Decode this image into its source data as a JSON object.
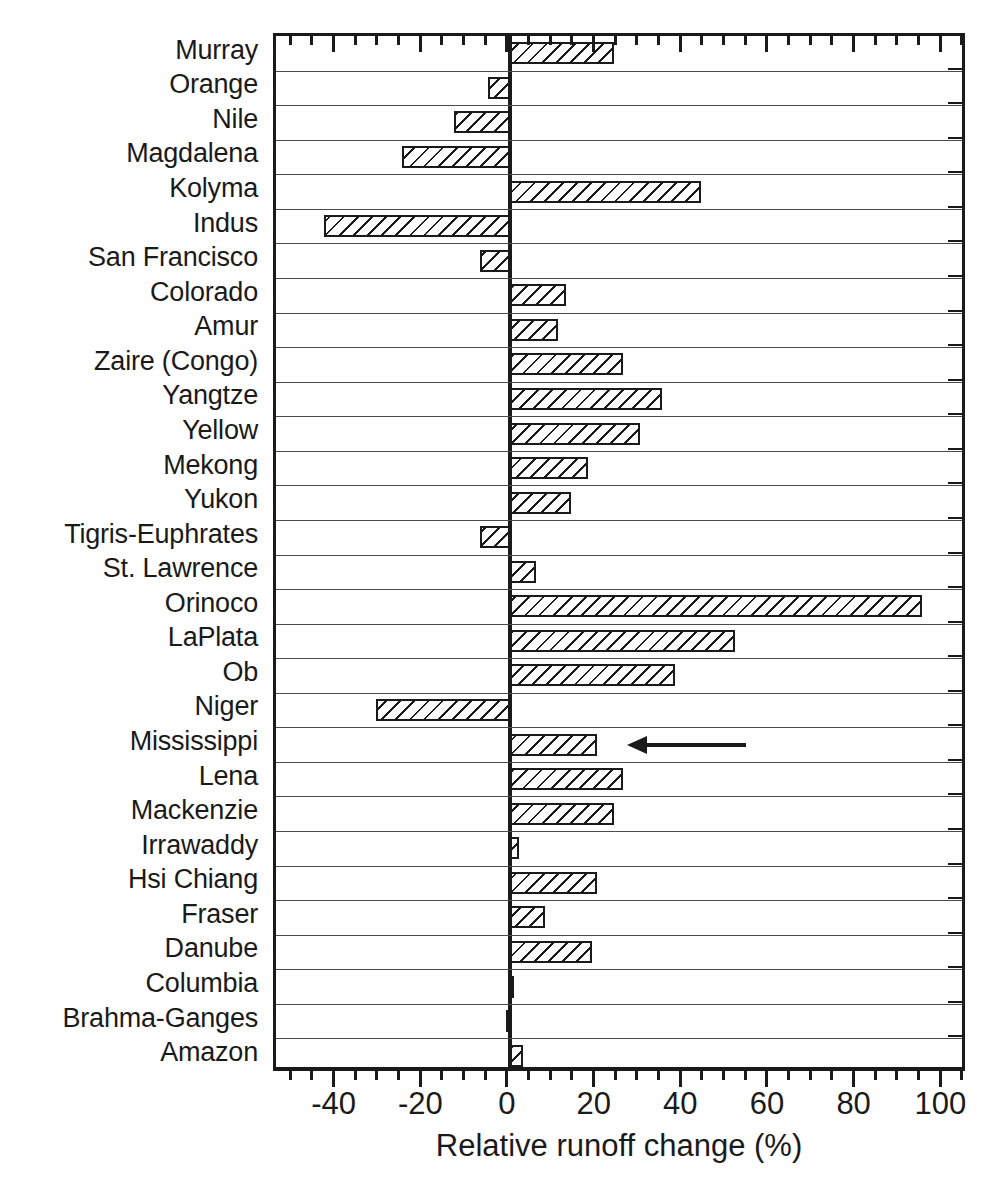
{
  "chart_data": {
    "type": "bar",
    "orientation": "horizontal",
    "title": "",
    "xlabel": "Relative runoff change (%)",
    "ylabel": "",
    "xlim": [
      -54,
      105.7
    ],
    "ylim": null,
    "grid": "horizontal-row-separators",
    "legend": null,
    "xticks": [
      -40,
      -20,
      0,
      20,
      40,
      60,
      80,
      100
    ],
    "xticklabels": [
      "-40",
      "-20",
      "0",
      "20",
      "40",
      "60",
      "80",
      "100"
    ],
    "minor_tick_interval": 5,
    "zero_reference_line": 0,
    "bar_style": "diagonal-hatch-outline",
    "categories": [
      "Murray",
      "Orange",
      "Nile",
      "Magdalena",
      "Kolyma",
      "Indus",
      "San Francisco",
      "Colorado",
      "Amur",
      "Zaire (Congo)",
      "Yangtze",
      "Yellow",
      "Mekong",
      "Yukon",
      "Tigris-Euphrates",
      "St. Lawrence",
      "Orinoco",
      "LaPlata",
      "Ob",
      "Niger",
      "Mississippi",
      "Lena",
      "Mackenzie",
      "Irrawaddy",
      "Hsi Chiang",
      "Fraser",
      "Danube",
      "Columbia",
      "Brahma-Ganges",
      "Amazon"
    ],
    "values": [
      24,
      -5,
      -13,
      -25,
      44,
      -43,
      -7,
      13,
      11,
      26,
      35,
      30,
      18,
      14,
      -7,
      6,
      95,
      52,
      38,
      -31,
      20,
      26,
      24,
      2,
      20,
      8,
      19,
      1,
      -1,
      3
    ],
    "annotations": [
      {
        "type": "arrow",
        "points_to_category": "Mississippi",
        "direction": "left",
        "x_start": 41,
        "x_end": 27,
        "label": ""
      }
    ]
  },
  "axis": {
    "x_title": "Relative runoff change (%)"
  }
}
